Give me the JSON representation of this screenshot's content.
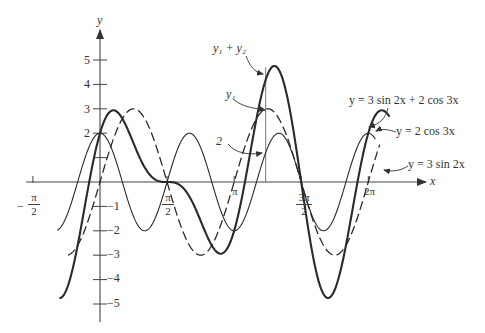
{
  "chart_data": {
    "type": "line",
    "title": "",
    "xlabel": "x",
    "ylabel": "y",
    "xlim": [
      -1.5708,
      6.6
    ],
    "ylim": [
      -5.6,
      6.2
    ],
    "grid": false,
    "x_ticks": [
      {
        "value": -1.5708,
        "label_num": "π",
        "label_den": "2",
        "sign": "−"
      },
      {
        "value": 1.5708,
        "label_num": "π",
        "label_den": "2",
        "sign": ""
      },
      {
        "value": 3.1416,
        "label": "π"
      },
      {
        "value": 4.7124,
        "label_num": "3π",
        "label_den": "2",
        "sign": ""
      },
      {
        "value": 6.2832,
        "label": "2π"
      }
    ],
    "y_ticks": [
      {
        "value": 5,
        "label": "5"
      },
      {
        "value": 4,
        "label": "4"
      },
      {
        "value": 3,
        "label": "3"
      },
      {
        "value": 2,
        "label": "2"
      },
      {
        "value": 1,
        "label": ""
      },
      {
        "value": -1,
        "label": "−1"
      },
      {
        "value": -2,
        "label": "−2"
      },
      {
        "value": -3,
        "label": "−3"
      },
      {
        "value": -4,
        "label": "−4"
      },
      {
        "value": -5,
        "label": "−5"
      }
    ],
    "series": [
      {
        "name": "y = 3 sin 2x",
        "short": "y1",
        "expr": "3 sin 2x",
        "a": 3,
        "kind": "sin",
        "k": 2,
        "domain": [
          -0.75,
          6.55
        ],
        "style": "dashed"
      },
      {
        "name": "y = 2 cos 3x",
        "short": "y2",
        "expr": "2 cos 3x",
        "a": 2,
        "kind": "cos",
        "k": 3,
        "domain": [
          -1.0,
          6.45
        ],
        "style": "thin"
      },
      {
        "name": "y = 3 sin 2x + 2 cos 3x",
        "short": "y1 + y2",
        "expr": "3 sin 2x + 2 cos 3x",
        "kind": "sum",
        "domain": [
          -0.95,
          6.78
        ],
        "style": "thick"
      }
    ],
    "annotations": [
      {
        "text": "y₁ + y₂",
        "points_to": "sum peak near x≈3.8"
      },
      {
        "text": "y₁",
        "points_to": "3 sin 2x at x≈3.8"
      },
      {
        "text": "y₂",
        "points_to": "2 cos 3x at x≈3.8"
      },
      {
        "text": "y = 3 sin 2x + 2 cos 3x"
      },
      {
        "text": "y = 2 cos 3x"
      },
      {
        "text": "y = 3 sin 2x"
      }
    ],
    "reference_line_x": 3.88
  },
  "labels": {
    "y_axis": "y",
    "x_axis": "x",
    "y1_plus_y2": "y₁ + y₂",
    "y1": "y₁",
    "y2": "2",
    "sum_eq": "y = 3 sin 2x + 2 cos 3x",
    "cos_eq": "y = 2 cos 3x",
    "sin_eq": "y = 3 sin 2x",
    "tick_neg_pi2_sign": "−",
    "tick_pi": "π",
    "tick_two": "2",
    "tick_3pi": "3π",
    "tick_pi_label": "π",
    "tick_2pi": "2π",
    "y5": "5",
    "y4": "4",
    "y3": "3",
    "ym1": "−1",
    "ym2": "−2",
    "ym3": "−3",
    "ym4": "−4",
    "ym5": "−5"
  }
}
